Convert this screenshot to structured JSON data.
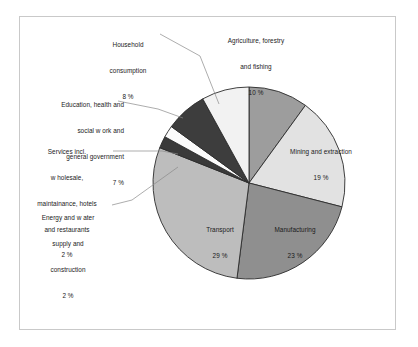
{
  "chart_data": {
    "type": "pie",
    "title": "",
    "subtitle": "",
    "xlabel": "",
    "ylabel": "",
    "grid": false,
    "legend_position": "none",
    "units": "percent",
    "value_suffix": " %",
    "total": 100,
    "start_angle_deg": 0,
    "direction": "clockwise",
    "categories": [
      "Agriculture, forestry and fishing",
      "Mining and extraction",
      "Manufacturing",
      "Transport",
      "Energy and w ater supply and construction",
      "Services incl. w holesale, maintainance, hotels and restaurants",
      "Education, health and social w ork and general government",
      "Household consumption"
    ],
    "values": [
      10,
      19,
      23,
      29,
      2,
      2,
      7,
      8
    ],
    "slices": [
      {
        "key": "agriculture",
        "label": "Agriculture, forestry and fishing",
        "label_lines": [
          "Agriculture, forestry",
          "and fishing"
        ],
        "value": 10,
        "value_text": "10 %",
        "color": "#9d9d9d",
        "label_placement": "outside-top"
      },
      {
        "key": "mining",
        "label": "Mining and extraction",
        "label_lines": [
          "Mining and extraction"
        ],
        "value": 19,
        "value_text": "19 %",
        "color": "#e2e2e2",
        "label_placement": "inside"
      },
      {
        "key": "manufacturing",
        "label": "Manufacturing",
        "label_lines": [
          "Manufacturing"
        ],
        "value": 23,
        "value_text": "23 %",
        "color": "#8f8f8f",
        "label_placement": "inside"
      },
      {
        "key": "transport",
        "label": "Transport",
        "label_lines": [
          "Transport"
        ],
        "value": 29,
        "value_text": "29 %",
        "color": "#bdbdbd",
        "label_placement": "inside"
      },
      {
        "key": "energy",
        "label": "Energy and w ater supply and construction",
        "label_lines": [
          "Energy and w ater",
          "supply and",
          "construction"
        ],
        "value": 2,
        "value_text": "2 %",
        "color": "#3a3a3a",
        "label_placement": "outside-left-leader"
      },
      {
        "key": "services",
        "label": "Services incl. w holesale, maintainance, hotels and restaurants",
        "label_lines": [
          "Services incl.",
          "w holesale,",
          "maintainance, hotels",
          "and restaurants"
        ],
        "value": 2,
        "value_text": "2 %",
        "color": "#fbfbfb",
        "label_placement": "outside-left-leader"
      },
      {
        "key": "education",
        "label": "Education, health and social w ork and general government",
        "label_lines": [
          "Education, health and",
          "social w ork and",
          "general government"
        ],
        "value": 7,
        "value_text": "7 %",
        "color": "#3d3d3d",
        "label_placement": "outside-left-leader"
      },
      {
        "key": "household",
        "label": "Household consumption",
        "label_lines": [
          "Household",
          "consumption"
        ],
        "value": 8,
        "value_text": "8 %",
        "color": "#f2f2f2",
        "label_placement": "outside-top-leader"
      }
    ]
  },
  "labels": {
    "household": {
      "line1": "Household",
      "line2": "consumption",
      "value": "8 %"
    },
    "agriculture": {
      "line1": "Agriculture, forestry",
      "line2": "and fishing",
      "value": "10 %"
    },
    "education": {
      "line1": "Education, health and",
      "line2": "social w ork and",
      "line3": "general government",
      "value": "7 %"
    },
    "services": {
      "line1": "Services incl.",
      "line2": "w holesale,",
      "line3": "maintainance, hotels",
      "line4": "and restaurants",
      "value": "2 %"
    },
    "energy": {
      "line1": "Energy and w ater",
      "line2": "supply and",
      "line3": "construction",
      "value": "2 %"
    },
    "mining": {
      "line1": "Mining and extraction",
      "value": "19 %"
    },
    "manufacturing": {
      "line1": "Manufacturing",
      "value": "23 %"
    },
    "transport": {
      "line1": "Transport",
      "value": "29 %"
    }
  },
  "style": {
    "frame_border_color": "#c9c9c9",
    "pie_outline_color": "#2b2b2b",
    "leader_line_color": "#8a8a8a",
    "text_color": "#1a1a1a",
    "background": "#ffffff"
  }
}
